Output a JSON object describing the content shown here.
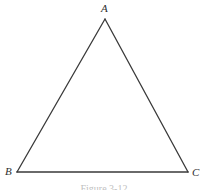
{
  "figure": {
    "background_color": "#ffffff",
    "stroke_color": "#3a3a3a",
    "label_color": "#2f2f2f",
    "caption": "Figure 3-12",
    "vertices": [
      {
        "name": "A",
        "label": "A",
        "x": 105,
        "y": 19
      },
      {
        "name": "B",
        "label": "B",
        "x": 17,
        "y": 172
      },
      {
        "name": "C",
        "label": "C",
        "x": 188,
        "y": 172
      }
    ],
    "edges": [
      {
        "name": "edge-AB",
        "from": "A",
        "to": "B"
      },
      {
        "name": "edge-AC",
        "from": "A",
        "to": "C"
      },
      {
        "name": "edge-BC",
        "from": "B",
        "to": "C"
      }
    ]
  }
}
